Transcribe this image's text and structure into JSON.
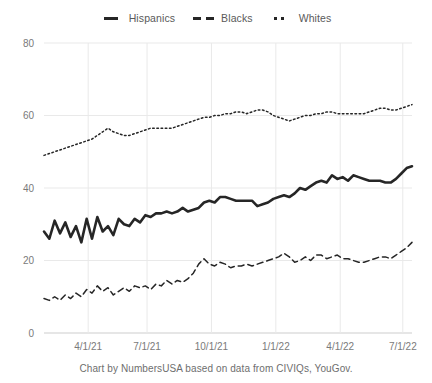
{
  "legend": {
    "position": "top-center",
    "items": [
      {
        "label": "Hispanics",
        "style": "solid",
        "icon": "solid-line-swatch-icon",
        "color": "#262626"
      },
      {
        "label": "Blacks",
        "style": "dashed",
        "icon": "dashed-line-swatch-icon",
        "color": "#262626"
      },
      {
        "label": "Whites",
        "style": "dotted",
        "icon": "dotted-line-swatch-icon",
        "color": "#262626"
      }
    ]
  },
  "caption": "Chart by NumbersUSA based on data from CIVIQs, YouGov.",
  "colors": {
    "line": "#262626",
    "grid": "#e9e9e9",
    "axis": "#cdcdcd",
    "tick_text": "#7a7a7a",
    "caption_text": "#6e6e6e",
    "background": "#ffffff"
  },
  "chart_data": {
    "type": "line",
    "title": "",
    "subtitle": "",
    "xlabel": "",
    "ylabel": "",
    "ylim": [
      0,
      80
    ],
    "yticks": [
      0,
      20,
      40,
      60,
      80
    ],
    "ytick_labels": [
      "0",
      "20",
      "40",
      "60",
      "80"
    ],
    "xticks": [
      "4/1/21",
      "7/1/21",
      "10/1/21",
      "1/1/22",
      "4/1/22",
      "7/1/22"
    ],
    "xtick_labels": [
      "4/1/21",
      "7/1/21",
      "10/1/21",
      "1/1/22",
      "4/1/22",
      "7/1/22"
    ],
    "xtick_fractions": [
      0.12,
      0.28,
      0.455,
      0.63,
      0.805,
      0.975
    ],
    "grid": true,
    "grid_axes": "both",
    "legend": true,
    "legend_position": "top-center",
    "n_points": 70,
    "series": [
      {
        "name": "Hispanics",
        "style": "solid",
        "values": [
          28,
          26,
          31,
          27.5,
          30.5,
          26.5,
          29.5,
          25,
          31.5,
          26,
          32,
          28,
          29.5,
          27,
          31.5,
          30,
          29.5,
          31.5,
          30.5,
          32.5,
          32,
          33,
          33,
          33.5,
          33,
          33.5,
          34.5,
          33.5,
          34,
          34.5,
          36,
          36.5,
          36,
          37.5,
          37.5,
          37,
          36.5,
          36.5,
          36.5,
          36.5,
          35,
          35.5,
          36,
          37,
          37.5,
          38,
          37.5,
          38.5,
          40,
          39.5,
          40.5,
          41.5,
          42,
          41.5,
          43.5,
          42.5,
          43,
          42,
          43.5,
          43,
          42.5,
          42,
          42,
          42,
          41.5,
          41.5,
          42.5,
          44,
          45.5,
          46
        ]
      },
      {
        "name": "Blacks",
        "style": "dashed",
        "values": [
          9.5,
          9,
          10,
          9,
          10.5,
          9.5,
          11,
          10,
          12,
          11,
          13,
          11.5,
          12.5,
          10.5,
          11.5,
          12.5,
          11.5,
          13,
          12.5,
          13,
          12,
          13.5,
          13,
          14.5,
          13.5,
          14.5,
          14,
          15,
          16.5,
          19,
          20.5,
          19,
          18.5,
          19.5,
          19,
          18,
          18.5,
          18.5,
          19,
          18.5,
          19,
          19.5,
          20,
          20.5,
          21,
          22,
          21,
          19.5,
          20,
          21,
          20,
          21.5,
          21.5,
          20.5,
          21,
          21.5,
          20.5,
          20.5,
          20,
          19.5,
          19.5,
          20,
          20.5,
          21,
          21,
          20.5,
          21.5,
          22.5,
          23.5,
          25
        ]
      },
      {
        "name": "Whites",
        "style": "dotted",
        "values": [
          49,
          49.5,
          50,
          50.5,
          51,
          51.5,
          52,
          52.5,
          53,
          53.5,
          54.5,
          55.5,
          56.5,
          55.5,
          55,
          54.5,
          54.5,
          55,
          55.5,
          56,
          56.5,
          56.5,
          56.5,
          56.5,
          56.5,
          57,
          57.5,
          58,
          58.5,
          59,
          59.5,
          59.5,
          60,
          60,
          60.5,
          60.5,
          61,
          61,
          60.5,
          61,
          61.5,
          61.5,
          61,
          60,
          59.5,
          59,
          58.5,
          59,
          59.5,
          60,
          60,
          60.5,
          60.5,
          61,
          61,
          60.5,
          60.5,
          60.5,
          60.5,
          60.5,
          60.5,
          61,
          61.5,
          62,
          62,
          61.5,
          61.5,
          62,
          62.5,
          63
        ]
      }
    ]
  }
}
